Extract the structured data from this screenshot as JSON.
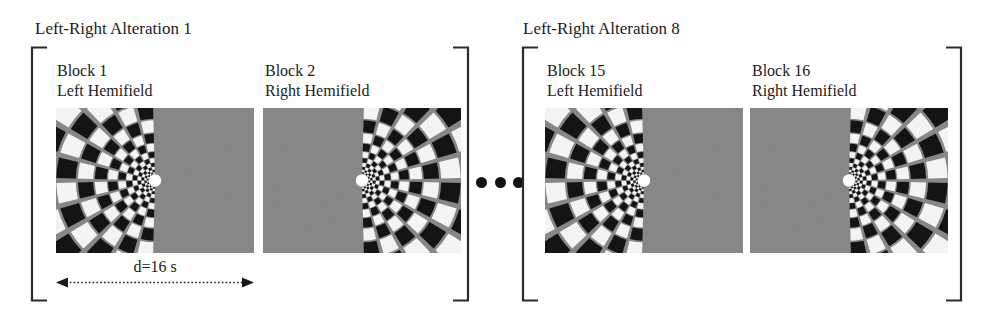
{
  "figure": {
    "background_color": "#ffffff",
    "stimulus_gray": "#878787",
    "ink_color": "#1c1c1c",
    "fixation_color": "#ffffff"
  },
  "ellipsis": {
    "name": "continuation-ellipsis",
    "dots": [
      "dot",
      "dot",
      "dot"
    ]
  },
  "duration": {
    "label": "d=16 s",
    "arrow_name": "duration-double-arrow"
  },
  "groups": [
    {
      "heading": "Left-Right Alteration 1",
      "panels": [
        {
          "block_label": "Block 1",
          "hemifield_label": "Left Hemifield",
          "stimulus_side": "left"
        },
        {
          "block_label": "Block 2",
          "hemifield_label": "Right Hemifield",
          "stimulus_side": "right"
        }
      ]
    },
    {
      "heading": "Left-Right Alteration 8",
      "panels": [
        {
          "block_label": "Block 15",
          "hemifield_label": "Left Hemifield",
          "stimulus_side": "left"
        },
        {
          "block_label": "Block 16",
          "hemifield_label": "Right Hemifield",
          "stimulus_side": "right"
        }
      ]
    }
  ]
}
